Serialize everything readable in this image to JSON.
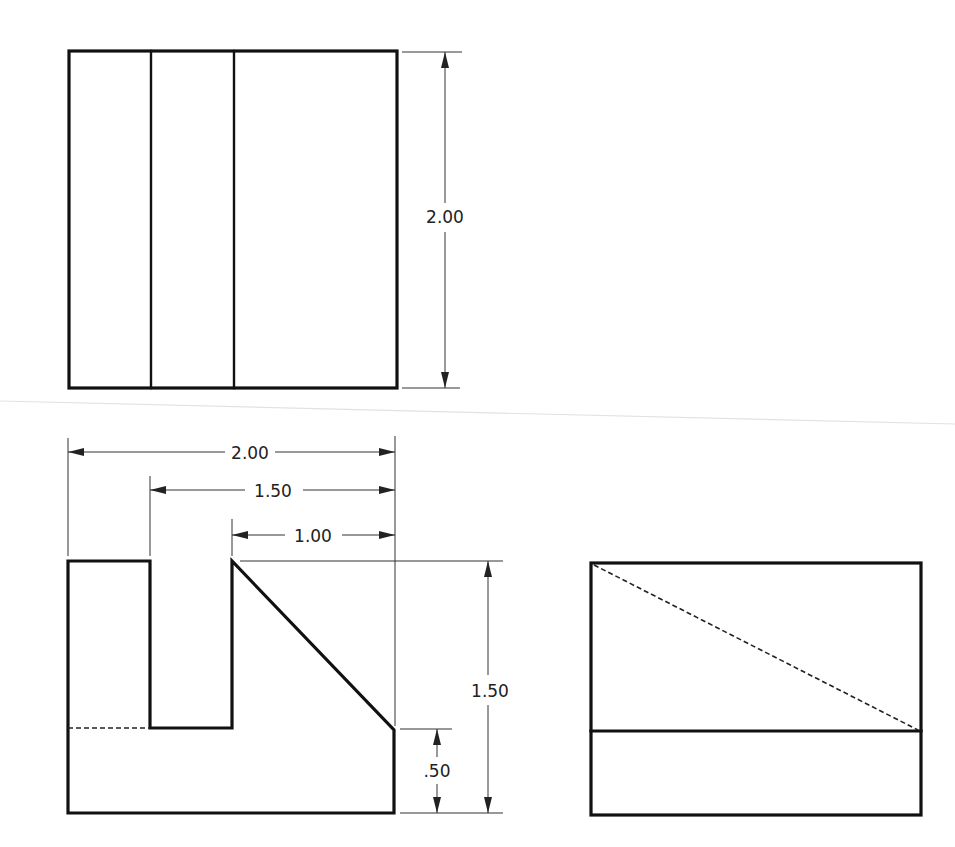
{
  "drawing": {
    "title": "Orthographic projection — three views",
    "views": [
      {
        "name": "top-view",
        "label": ""
      },
      {
        "name": "front-view",
        "label": ""
      },
      {
        "name": "right-side-view",
        "label": ""
      }
    ],
    "dimensions": {
      "top_view_depth": "2.00",
      "front_overall_width": "2.00",
      "front_slot_to_right": "1.50",
      "front_chamfer_width": "1.00",
      "front_overall_height": "1.50",
      "front_base_height": ".50"
    },
    "colors": {
      "object_line": "#111111",
      "dimension_line": "#333333",
      "background": "#ffffff"
    }
  }
}
